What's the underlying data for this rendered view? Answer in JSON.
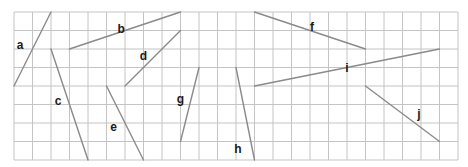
{
  "grid": {
    "origin_x": 14,
    "origin_y": 12,
    "cell": 18.5,
    "cols": 24,
    "rows": 8,
    "line_color": "#c4c4c4"
  },
  "segments": [
    {
      "label": "a",
      "from": [
        0,
        4
      ],
      "to": [
        2,
        0
      ],
      "label_pos": [
        0.15,
        1.8
      ]
    },
    {
      "label": "b",
      "from": [
        3,
        2
      ],
      "to": [
        9,
        0
      ],
      "label_pos": [
        5.6,
        0.9
      ]
    },
    {
      "label": "c",
      "from": [
        2,
        2
      ],
      "to": [
        4,
        8
      ],
      "label_pos": [
        2.2,
        4.8
      ]
    },
    {
      "label": "d",
      "from": [
        6,
        4
      ],
      "to": [
        9,
        1
      ],
      "label_pos": [
        6.8,
        2.4
      ]
    },
    {
      "label": "e",
      "from": [
        5,
        4
      ],
      "to": [
        7,
        8
      ],
      "label_pos": [
        5.2,
        6.2
      ]
    },
    {
      "label": "f",
      "from": [
        13,
        0
      ],
      "to": [
        19,
        2
      ],
      "label_pos": [
        16.0,
        0.8
      ]
    },
    {
      "label": "g",
      "from": [
        9,
        7
      ],
      "to": [
        10,
        3
      ],
      "label_pos": [
        8.8,
        4.7
      ]
    },
    {
      "label": "h",
      "from": [
        12,
        3
      ],
      "to": [
        13,
        8
      ],
      "label_pos": [
        11.9,
        7.4
      ]
    },
    {
      "label": "i",
      "from": [
        13,
        4
      ],
      "to": [
        23,
        2
      ],
      "label_pos": [
        17.9,
        3.0
      ]
    },
    {
      "label": "j",
      "from": [
        19,
        4
      ],
      "to": [
        23,
        7
      ],
      "label_pos": [
        21.8,
        5.5
      ]
    }
  ],
  "segment_color": "#8a8a8a",
  "label_color": "#1a1a1a"
}
